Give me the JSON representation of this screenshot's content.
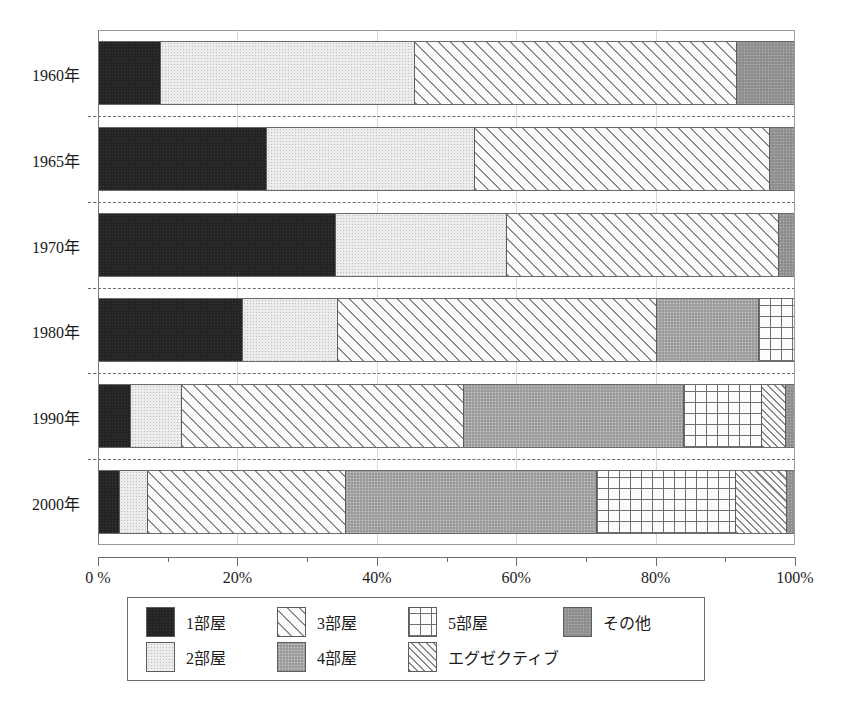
{
  "chart_data": {
    "type": "bar",
    "orientation": "horizontal",
    "stacked": true,
    "stack_mode": "percent",
    "title": "",
    "xlabel": "",
    "ylabel": "",
    "xlim": [
      0,
      100
    ],
    "grid": true,
    "legend_position": "bottom",
    "categories": [
      "1960年",
      "1965年",
      "1970年",
      "1980年",
      "1990年",
      "2000年"
    ],
    "xticks": [
      {
        "value": 0,
        "label": "0 %"
      },
      {
        "value": 10,
        "label": ""
      },
      {
        "value": 20,
        "label": "20%"
      },
      {
        "value": 30,
        "label": ""
      },
      {
        "value": 40,
        "label": "40%"
      },
      {
        "value": 50,
        "label": ""
      },
      {
        "value": 60,
        "label": "60%"
      },
      {
        "value": 70,
        "label": ""
      },
      {
        "value": 80,
        "label": "80%"
      },
      {
        "value": 90,
        "label": ""
      },
      {
        "value": 100,
        "label": "100%"
      }
    ],
    "gridlines": [
      20,
      40,
      60,
      80
    ],
    "series": [
      {
        "name": "1部屋",
        "pattern": "solid-black",
        "values": [
          8.9,
          24.1,
          34.1,
          20.7,
          4.6,
          3.0
        ]
      },
      {
        "name": "2部屋",
        "pattern": "light-stipple",
        "values": [
          36.6,
          30.0,
          24.6,
          13.7,
          7.3,
          4.0
        ]
      },
      {
        "name": "3部屋",
        "pattern": "wide-diagonal",
        "values": [
          46.3,
          42.5,
          39.1,
          45.9,
          40.6,
          28.6
        ]
      },
      {
        "name": "4部屋",
        "pattern": "mid-gray",
        "values": [
          0,
          0,
          0,
          14.7,
          31.7,
          36.0
        ]
      },
      {
        "name": "5部屋",
        "pattern": "cross-grid",
        "values": [
          0,
          0,
          0,
          5.0,
          11.2,
          20.0
        ]
      },
      {
        "name": "エグゼクティブ",
        "pattern": "fine-diagonal",
        "values": [
          0,
          0,
          0,
          0,
          3.4,
          7.4
        ]
      },
      {
        "name": "その他",
        "pattern": "dark-gray",
        "values": [
          8.2,
          3.4,
          2.2,
          0,
          1.2,
          1.0
        ]
      }
    ]
  },
  "legend": {
    "items": [
      {
        "label": "1部屋",
        "pattern": "solid-black"
      },
      {
        "label": "3部屋",
        "pattern": "wide-diagonal"
      },
      {
        "label": "5部屋",
        "pattern": "cross-grid"
      },
      {
        "label": "その他",
        "pattern": "dark-gray"
      },
      {
        "label": "2部屋",
        "pattern": "light-stipple"
      },
      {
        "label": "4部屋",
        "pattern": "mid-gray"
      },
      {
        "label": "エグゼクティブ",
        "pattern": "fine-diagonal"
      }
    ]
  },
  "colors": {
    "room1": "#242424",
    "room2": "#ececec",
    "room3": "#fbfbfb",
    "room4": "#a3a3a3",
    "room5": "#fdfdfd",
    "exec": "#fafafa",
    "other": "#949494",
    "axis": "#6d6d6d",
    "grid": "#d7d7d7"
  }
}
